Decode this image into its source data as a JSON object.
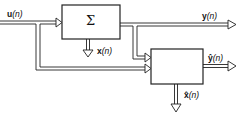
{
  "diagram": {
    "type": "block-diagram",
    "blocks": [
      {
        "id": "system",
        "label": "Σ"
      },
      {
        "id": "estimator",
        "label": ""
      }
    ],
    "signals": {
      "input": {
        "name": "u",
        "arg": "(n)"
      },
      "output": {
        "name": "y",
        "arg": "(n)"
      },
      "state": {
        "name": "x",
        "arg": "(n)"
      },
      "output_estimate": {
        "name": "ŷ",
        "arg": "(n)"
      },
      "state_estimate": {
        "name": "x̂",
        "arg": "(n)"
      }
    },
    "connections": [
      {
        "from": "u(n)",
        "to": "system"
      },
      {
        "from": "u(n)",
        "to": "estimator"
      },
      {
        "from": "system",
        "to": "y(n)"
      },
      {
        "from": "y(n)",
        "to": "estimator"
      },
      {
        "from": "system",
        "to": "x(n)"
      },
      {
        "from": "estimator",
        "to": "ŷ(n)"
      },
      {
        "from": "estimator",
        "to": "x̂(n)"
      }
    ]
  }
}
